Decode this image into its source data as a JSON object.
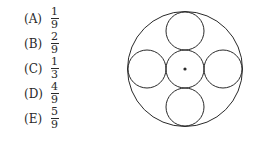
{
  "choices": [
    {
      "label": "(A)",
      "numerator": "1",
      "denominator": "9"
    },
    {
      "label": "(B)",
      "numerator": "2",
      "denominator": "9"
    },
    {
      "label": "(C)",
      "numerator": "1",
      "denominator": "3"
    },
    {
      "label": "(D)",
      "numerator": "4",
      "denominator": "9"
    },
    {
      "label": "(E)",
      "numerator": "5",
      "denominator": "9"
    }
  ],
  "figure": {
    "stroke_color": "#2a2a2a"
  }
}
